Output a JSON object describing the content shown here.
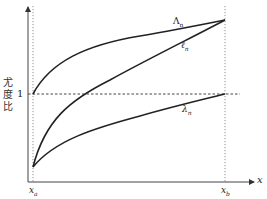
{
  "diagram": {
    "y_axis_label_chars": [
      "尤",
      "度",
      "比"
    ],
    "y_tick_label": "1",
    "x_axis_label": "x",
    "x_ticks": [
      {
        "label": "x",
        "subscript": "a"
      },
      {
        "label": "x",
        "subscript": "b"
      }
    ],
    "curves": [
      {
        "name": "Lambda",
        "label": "Λ",
        "subscript": "n",
        "from": "(x_a, 1)",
        "to": "(x_b, top)"
      },
      {
        "name": "ell",
        "label": "ℓ",
        "subscript": "n",
        "from": "(x_a, bottom)",
        "to": "(x_b, top)"
      },
      {
        "name": "lambda",
        "label": "λ",
        "subscript": "n",
        "from": "(x_a, bottom)",
        "to": "(x_b, 1)"
      }
    ],
    "colors": {
      "curve": "#222222",
      "axis": "#444444",
      "guide": "#555555"
    }
  }
}
